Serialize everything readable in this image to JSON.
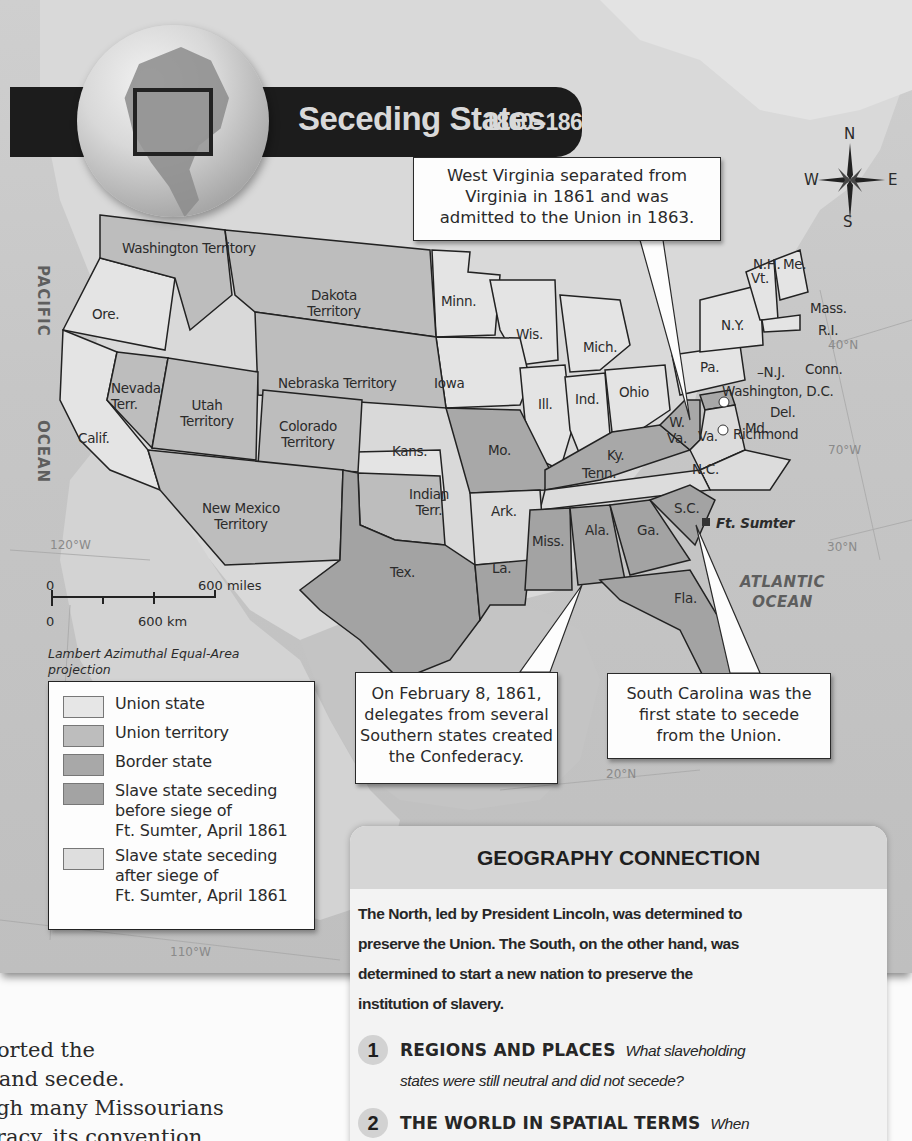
{
  "map": {
    "title": "Seceding States",
    "years": "1860–1861",
    "compass": {
      "n": "N",
      "s": "S",
      "e": "E",
      "w": "W"
    },
    "oceans": {
      "pacific": [
        "PACIFIC",
        "OCEAN"
      ],
      "atlantic": [
        "ATLANTIC",
        "OCEAN"
      ]
    },
    "gridlines": [
      "40°N",
      "70°W",
      "30°N",
      "120°W",
      "20°N",
      "110°W"
    ],
    "regions": [
      {
        "label": "Washington Territory",
        "status": "Union territory"
      },
      {
        "label": "Ore.",
        "status": "Union state"
      },
      {
        "label": "Calif.",
        "status": "Union state"
      },
      {
        "label": "Nevada Terr.",
        "status": "Union territory"
      },
      {
        "label": "Utah Territory",
        "status": "Union territory"
      },
      {
        "label": "Dakota Territory",
        "status": "Union territory"
      },
      {
        "label": "Nebraska Territory",
        "status": "Union territory"
      },
      {
        "label": "Colorado Territory",
        "status": "Union territory"
      },
      {
        "label": "New Mexico Territory",
        "status": "Union territory"
      },
      {
        "label": "Indian Terr.",
        "status": "Union territory"
      },
      {
        "label": "Kans.",
        "status": "Union state"
      },
      {
        "label": "Minn.",
        "status": "Union state"
      },
      {
        "label": "Iowa",
        "status": "Union state"
      },
      {
        "label": "Wis.",
        "status": "Union state"
      },
      {
        "label": "Mich.",
        "status": "Union state"
      },
      {
        "label": "Ill.",
        "status": "Union state"
      },
      {
        "label": "Ind.",
        "status": "Union state"
      },
      {
        "label": "Ohio",
        "status": "Union state"
      },
      {
        "label": "Pa.",
        "status": "Union state"
      },
      {
        "label": "N.Y.",
        "status": "Union state"
      },
      {
        "label": "N.J.",
        "status": "Union state"
      },
      {
        "label": "Vt.",
        "status": "Union state"
      },
      {
        "label": "N.H.",
        "status": "Union state"
      },
      {
        "label": "Me.",
        "status": "Union state"
      },
      {
        "label": "Mass.",
        "status": "Union state"
      },
      {
        "label": "R.I.",
        "status": "Union state"
      },
      {
        "label": "Conn.",
        "status": "Union state"
      },
      {
        "label": "Mo.",
        "status": "Border state"
      },
      {
        "label": "Ky.",
        "status": "Border state"
      },
      {
        "label": "W. Va.",
        "status": "Border state"
      },
      {
        "label": "Md.",
        "status": "Border state"
      },
      {
        "label": "Del.",
        "status": "Border state"
      },
      {
        "label": "Va.",
        "status": "Slave state seceding after siege of Ft. Sumter, April 1861"
      },
      {
        "label": "N.C.",
        "status": "Slave state seceding after siege of Ft. Sumter, April 1861"
      },
      {
        "label": "Tenn.",
        "status": "Slave state seceding after siege of Ft. Sumter, April 1861"
      },
      {
        "label": "Ark.",
        "status": "Slave state seceding after siege of Ft. Sumter, April 1861"
      },
      {
        "label": "S.C.",
        "status": "Slave state seceding before siege of Ft. Sumter, April 1861"
      },
      {
        "label": "Ga.",
        "status": "Slave state seceding before siege of Ft. Sumter, April 1861"
      },
      {
        "label": "Ala.",
        "status": "Slave state seceding before siege of Ft. Sumter, April 1861"
      },
      {
        "label": "Miss.",
        "status": "Slave state seceding before siege of Ft. Sumter, April 1861"
      },
      {
        "label": "La.",
        "status": "Slave state seceding before siege of Ft. Sumter, April 1861"
      },
      {
        "label": "Fla.",
        "status": "Slave state seceding before siege of Ft. Sumter, April 1861"
      },
      {
        "label": "Tex.",
        "status": "Slave state seceding before siege of Ft. Sumter, April 1861"
      }
    ],
    "cities": [
      "Washington, D.C.",
      "Richmond"
    ],
    "landmark": "Ft. Sumter",
    "callouts": {
      "west_virginia": [
        "West Virginia separated from",
        "Virginia in 1861 and was",
        "admitted to the Union in 1863."
      ],
      "confederacy": [
        "On February 8, 1861,",
        "delegates from several",
        "Southern states created",
        "the Confederacy."
      ],
      "south_carolina": [
        "South Carolina was the",
        "first state to secede",
        "from the Union."
      ]
    },
    "scale": {
      "zero": "0",
      "miles": "600 miles",
      "km": "600 km"
    },
    "projection": [
      "Lambert Azimuthal Equal-Area",
      "projection"
    ],
    "legend": [
      {
        "label": [
          "Union state"
        ],
        "color": "#e6e6e6"
      },
      {
        "label": [
          "Union territory"
        ],
        "color": "#bdbdbd"
      },
      {
        "label": [
          "Border state"
        ],
        "color": "#a8a8a8"
      },
      {
        "label": [
          "Slave state seceding",
          "before siege of",
          "Ft. Sumter, April 1861"
        ],
        "color": "#a3a3a3"
      },
      {
        "label": [
          "Slave state seceding",
          "after siege of",
          "Ft. Sumter, April 1861"
        ],
        "color": "#dedede"
      }
    ]
  },
  "geography_connection": {
    "title": "GEOGRAPHY CONNECTION",
    "paragraph_lines": [
      "The North, led by President Lincoln, was determined to",
      "preserve the Union. The South, on the other hand, was",
      "determined to start a new nation to preserve the",
      "institution of slavery."
    ],
    "questions": [
      {
        "number": "1",
        "heading": "REGIONS AND PLACES",
        "text_lines": [
          "What slaveholding",
          "states were still neutral and did not secede?"
        ]
      },
      {
        "number": "2",
        "heading": "THE WORLD IN SPATIAL TERMS",
        "text_lines": [
          "When",
          ""
        ]
      }
    ]
  },
  "body_text": [
    "pported the",
    "nt and secede.",
    "ough many Missourians",
    "deracy, its convention"
  ],
  "colors": {
    "title_bar": "#1c1c1c",
    "union_state": "#e6e6e6",
    "union_territory": "#bdbdbd",
    "border_state": "#a8a8a8",
    "seceding_before": "#a3a3a3",
    "seceding_after": "#dedede",
    "ocean": "#c9c9c9",
    "panel_header": "#d6d6d6"
  }
}
